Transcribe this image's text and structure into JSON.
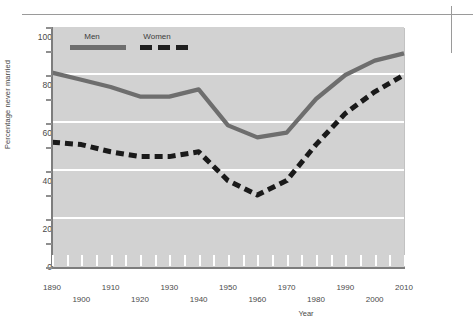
{
  "chart_data": {
    "type": "line",
    "title": "",
    "xlabel": "Year",
    "ylabel": "Percentage never married",
    "xlim": [
      1890,
      2010
    ],
    "ylim": [
      0,
      100
    ],
    "yticks": [
      0,
      20,
      40,
      60,
      80,
      100
    ],
    "xticks": [
      1890,
      1895,
      1900,
      1905,
      1910,
      1915,
      1920,
      1925,
      1930,
      1935,
      1940,
      1945,
      1950,
      1955,
      1960,
      1965,
      1970,
      1975,
      1980,
      1985,
      1990,
      1995,
      2000,
      2005,
      2010
    ],
    "xtick_labels_top_row": [
      "1890",
      "1910",
      "1930",
      "1950",
      "1970",
      "1990",
      "2010"
    ],
    "xtick_labels_bottom_row": [
      "1900",
      "1920",
      "1940",
      "1960",
      "1980",
      "2000"
    ],
    "grid": "horizontal-white",
    "legend_position": "top-left-inside",
    "x": [
      1890,
      1900,
      1910,
      1920,
      1930,
      1940,
      1950,
      1960,
      1970,
      1980,
      1990,
      2000,
      2010
    ],
    "series": [
      {
        "name": "Men",
        "style": "solid",
        "color": "#6e6e6e",
        "values": [
          81,
          78,
          75,
          71,
          71,
          74,
          59,
          54,
          56,
          70,
          80,
          86,
          89
        ]
      },
      {
        "name": "Women",
        "style": "dashed",
        "color": "#1a1a1a",
        "values": [
          52,
          51,
          48,
          46,
          46,
          48,
          36,
          30,
          36,
          51,
          64,
          73,
          80
        ]
      }
    ]
  },
  "legend": {
    "men_label": "Men",
    "women_label": "Women"
  },
  "axes": {
    "y_title": "Percentage never married",
    "x_title": "Year",
    "y_values": [
      "100",
      "80",
      "60",
      "40",
      "20",
      "0"
    ]
  }
}
